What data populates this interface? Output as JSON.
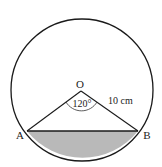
{
  "diagram": {
    "type": "circle-segment",
    "center_label": "O",
    "point_a_label": "A",
    "point_b_label": "B",
    "angle_label": "120°",
    "radius_label": "10 cm",
    "colors": {
      "stroke": "#1a1a1a",
      "segment_fill": "#b9b9b9",
      "background": "#ffffff"
    },
    "geometry": {
      "center": [
        82,
        90
      ],
      "radius": 71,
      "A": [
        21,
        127
      ],
      "B": [
        142,
        127
      ],
      "O": [
        82,
        91
      ]
    }
  }
}
